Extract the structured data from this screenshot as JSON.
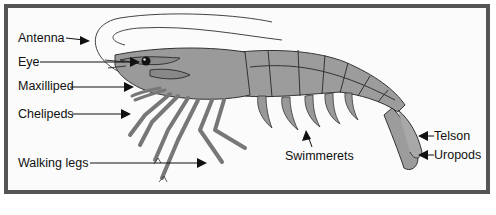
{
  "diagram": {
    "colors": {
      "body_fill": "#9a9a9a",
      "outline": "#333333",
      "frame_border": "#555555",
      "background": "#fbfbfb",
      "label_text": "#111111"
    },
    "labels": {
      "antenna": "Antenna",
      "eye": "Eye",
      "maxilliped": "Maxilliped",
      "chelipeds": "Chelipeds",
      "walking_legs": "Walking legs",
      "swimmerets": "Swimmerets",
      "telson": "Telson",
      "uropods": "Uropods"
    },
    "caption": ""
  }
}
